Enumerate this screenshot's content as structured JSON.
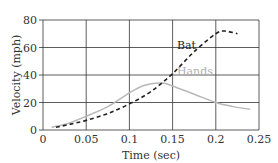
{
  "chart_data": {
    "type": "line",
    "title": "",
    "xlabel": "Time (sec)",
    "ylabel": "Velocity (mph)",
    "xlim": [
      0,
      0.25
    ],
    "ylim": [
      0,
      80
    ],
    "x_ticks": [
      0,
      0.05,
      0.1,
      0.15,
      0.2,
      0.25
    ],
    "x_tick_labels": [
      "0",
      "0.05",
      "0.1",
      "0.15",
      "0.2",
      "0.25"
    ],
    "y_ticks": [
      0,
      20,
      40,
      60,
      80
    ],
    "y_tick_labels": [
      "0",
      "20",
      "40",
      "60",
      "80"
    ],
    "grid": true,
    "legend": "inline labels",
    "series": [
      {
        "name": "Bat",
        "style": "dashed",
        "color": "#222222",
        "label_color": "#222222",
        "x": [
          0.015,
          0.03,
          0.05,
          0.075,
          0.1,
          0.125,
          0.15,
          0.175,
          0.2,
          0.21,
          0.225
        ],
        "values": [
          2,
          4,
          7,
          12,
          19,
          28,
          41,
          57,
          70,
          72,
          70
        ]
      },
      {
        "name": "Hands",
        "style": "solid",
        "color": "#b8b8b8",
        "label_color": "#b0b0b0",
        "x": [
          0.01,
          0.03,
          0.05,
          0.075,
          0.1,
          0.115,
          0.13,
          0.14,
          0.15,
          0.175,
          0.2,
          0.22,
          0.24
        ],
        "values": [
          2,
          5,
          10,
          17,
          27,
          32,
          34,
          34,
          32,
          26,
          20,
          17,
          15
        ]
      }
    ]
  }
}
